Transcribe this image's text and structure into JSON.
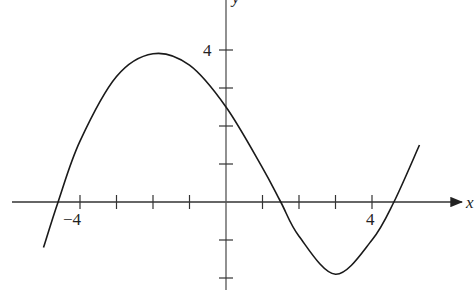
{
  "chart_data": {
    "type": "line",
    "title": "",
    "xlabel": "x",
    "ylabel": "y",
    "xlim": [
      -5.8,
      6.5
    ],
    "ylim": [
      -2.3,
      5.3
    ],
    "x_tick_labels": [
      {
        "value": -4,
        "label": "−4"
      },
      {
        "value": 4,
        "label": "4"
      }
    ],
    "y_tick_labels": [
      {
        "value": 4,
        "label": "4"
      }
    ],
    "x_ticks": [
      -4,
      -3,
      -2,
      -1,
      1,
      2,
      3,
      4
    ],
    "y_ticks": [
      -2,
      -1,
      1,
      2,
      3,
      4
    ],
    "grid": false,
    "legend": null,
    "series": [
      {
        "name": "f(x)",
        "x": [
          -5.0,
          -4.6,
          -4.0,
          -3.0,
          -2.0,
          -1.0,
          0.0,
          1.0,
          1.5,
          2.0,
          3.0,
          4.0,
          4.6,
          5.3
        ],
        "y": [
          -1.2,
          0.0,
          1.6,
          3.3,
          3.9,
          3.6,
          2.5,
          0.9,
          0.0,
          -0.9,
          -1.9,
          -1.0,
          0.0,
          1.5
        ]
      }
    ],
    "annotations": []
  },
  "labels": {
    "x_axis": "x",
    "y_axis": "y",
    "x_neg4": "−4",
    "x_pos4": "4",
    "y_pos4": "4"
  },
  "colors": {
    "line": "#1a1a1a",
    "axis": "#333333"
  }
}
